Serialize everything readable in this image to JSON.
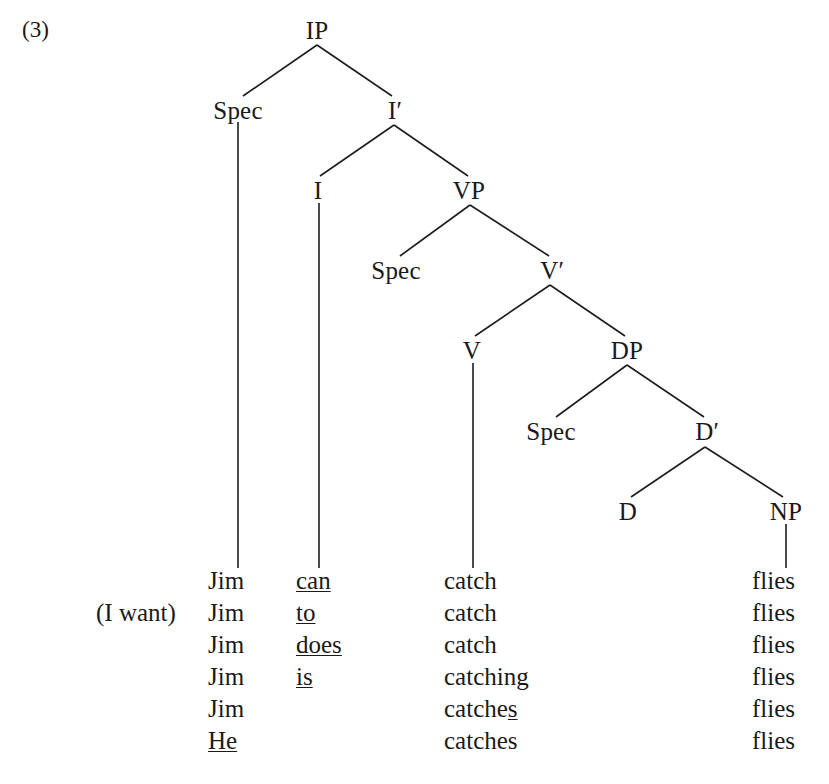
{
  "figure": {
    "example_number": "(3)",
    "caption": ""
  },
  "tree": {
    "nodes": [
      {
        "id": "IP",
        "label": "IP",
        "x": 317,
        "y": 30
      },
      {
        "id": "SpecIP",
        "label": "Spec",
        "x": 238,
        "y": 110
      },
      {
        "id": "Ibar",
        "label": "I′",
        "x": 395,
        "y": 110
      },
      {
        "id": "I",
        "label": "I",
        "x": 318,
        "y": 190
      },
      {
        "id": "VP",
        "label": "VP",
        "x": 469,
        "y": 190
      },
      {
        "id": "SpecVP",
        "label": "Spec",
        "x": 396,
        "y": 270
      },
      {
        "id": "Vbar",
        "label": "V′",
        "x": 552,
        "y": 270
      },
      {
        "id": "V",
        "label": "V",
        "x": 472,
        "y": 350
      },
      {
        "id": "DP",
        "label": "DP",
        "x": 627,
        "y": 350
      },
      {
        "id": "SpecDP",
        "label": "Spec",
        "x": 551,
        "y": 431
      },
      {
        "id": "Dbar",
        "label": "D′",
        "x": 707,
        "y": 431
      },
      {
        "id": "D",
        "label": "D",
        "x": 628,
        "y": 511
      },
      {
        "id": "NP",
        "label": "NP",
        "x": 786,
        "y": 511
      }
    ],
    "edges": [
      {
        "from": "IP",
        "to": "SpecIP",
        "x1": 317,
        "y1": 45,
        "x2": 243,
        "y2": 96
      },
      {
        "from": "IP",
        "to": "Ibar",
        "x1": 317,
        "y1": 45,
        "x2": 392,
        "y2": 96
      },
      {
        "from": "Ibar",
        "to": "I",
        "x1": 394,
        "y1": 125,
        "x2": 320,
        "y2": 176
      },
      {
        "from": "Ibar",
        "to": "VP",
        "x1": 394,
        "y1": 125,
        "x2": 468,
        "y2": 176
      },
      {
        "from": "VP",
        "to": "SpecVP",
        "x1": 470,
        "y1": 205,
        "x2": 400,
        "y2": 256
      },
      {
        "from": "VP",
        "to": "Vbar",
        "x1": 470,
        "y1": 205,
        "x2": 549,
        "y2": 256
      },
      {
        "from": "Vbar",
        "to": "V",
        "x1": 550,
        "y1": 285,
        "x2": 475,
        "y2": 336
      },
      {
        "from": "Vbar",
        "to": "DP",
        "x1": 550,
        "y1": 285,
        "x2": 625,
        "y2": 336
      },
      {
        "from": "DP",
        "to": "SpecDP",
        "x1": 627,
        "y1": 365,
        "x2": 556,
        "y2": 417
      },
      {
        "from": "DP",
        "to": "Dbar",
        "x1": 627,
        "y1": 365,
        "x2": 704,
        "y2": 417
      },
      {
        "from": "Dbar",
        "to": "D",
        "x1": 705,
        "y1": 447,
        "x2": 631,
        "y2": 497
      },
      {
        "from": "Dbar",
        "to": "NP",
        "x1": 705,
        "y1": 447,
        "x2": 783,
        "y2": 497
      },
      {
        "from": "SpecIP",
        "to": "word-subject",
        "x1": 238,
        "y1": 122,
        "x2": 238,
        "y2": 568
      },
      {
        "from": "I",
        "to": "word-infl",
        "x1": 319,
        "y1": 203,
        "x2": 319,
        "y2": 568
      },
      {
        "from": "V",
        "to": "word-verb",
        "x1": 473,
        "y1": 363,
        "x2": 473,
        "y2": 568
      },
      {
        "from": "NP",
        "to": "word-object",
        "x1": 786,
        "y1": 524,
        "x2": 786,
        "y2": 568
      }
    ]
  },
  "word_rows": [
    {
      "prefix": {
        "text": "",
        "underline": "none"
      },
      "subject": {
        "text": "Jim",
        "underline": "none"
      },
      "infl": {
        "text": "can",
        "underline": "full"
      },
      "verb": {
        "text": "catch",
        "underline": "none"
      },
      "object": {
        "text": "flies",
        "underline": "none"
      }
    },
    {
      "prefix": {
        "text": "(I want)",
        "underline": "none"
      },
      "subject": {
        "text": "Jim",
        "underline": "none"
      },
      "infl": {
        "text": "to",
        "underline": "full"
      },
      "verb": {
        "text": "catch",
        "underline": "none"
      },
      "object": {
        "text": "flies",
        "underline": "none"
      }
    },
    {
      "prefix": {
        "text": "",
        "underline": "none"
      },
      "subject": {
        "text": "Jim",
        "underline": "none"
      },
      "infl": {
        "text": "does",
        "underline": "full"
      },
      "verb": {
        "text": "catch",
        "underline": "none"
      },
      "object": {
        "text": "flies",
        "underline": "none"
      }
    },
    {
      "prefix": {
        "text": "",
        "underline": "none"
      },
      "subject": {
        "text": "Jim",
        "underline": "none"
      },
      "infl": {
        "text": "is",
        "underline": "full"
      },
      "verb": {
        "text": "catching",
        "underline": "none"
      },
      "object": {
        "text": "flies",
        "underline": "none"
      }
    },
    {
      "prefix": {
        "text": "",
        "underline": "none"
      },
      "subject": {
        "text": "Jim",
        "underline": "none"
      },
      "infl": {
        "text": "",
        "underline": "none"
      },
      "verb": {
        "text": "catches",
        "underline": "suffix",
        "stem": "catche",
        "suffix": "s"
      },
      "object": {
        "text": "flies",
        "underline": "none"
      }
    },
    {
      "prefix": {
        "text": "",
        "underline": "none"
      },
      "subject": {
        "text": "He",
        "underline": "full"
      },
      "infl": {
        "text": "",
        "underline": "none"
      },
      "verb": {
        "text": "catches",
        "underline": "none"
      },
      "object": {
        "text": "flies",
        "underline": "none"
      }
    }
  ],
  "colors": {
    "ink": "#1a1a1a",
    "line": "#1d1d1d",
    "background": "#ffffff"
  }
}
